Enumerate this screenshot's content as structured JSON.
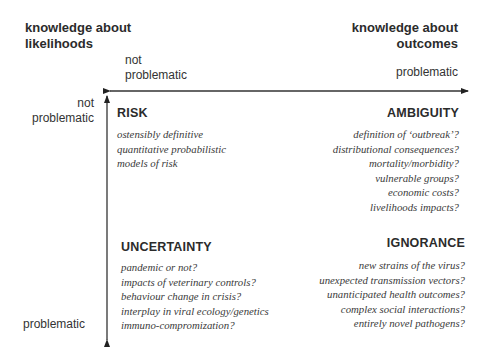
{
  "axes": {
    "likelihoods": {
      "title_line1": "knowledge about",
      "title_line2": "likelihoods",
      "top_label_line1": "not",
      "top_label_line2": "problematic",
      "bottom_label": "problematic"
    },
    "outcomes": {
      "title_line1": "knowledge about",
      "title_line2": "outcomes",
      "left_label_line1": "not",
      "left_label_line2": "problematic",
      "right_label": "problematic"
    }
  },
  "quadrants": {
    "risk": {
      "title": "RISK",
      "items": [
        "ostensibly definitive",
        "quantitative  probabilistic",
        "models of risk"
      ]
    },
    "ambiguity": {
      "title": "AMBIGUITY",
      "items": [
        "definition of ‘outbreak’?",
        "distributional consequences?",
        "mortality/morbidity?",
        "vulnerable groups?",
        "economic costs?",
        "livelihoods impacts?"
      ]
    },
    "uncertainty": {
      "title": "UNCERTAINTY",
      "items": [
        "pandemic or not?",
        "impacts of veterinary controls?",
        "behaviour change in crisis?",
        "interplay in viral ecology/genetics",
        "immuno-compromization?"
      ]
    },
    "ignorance": {
      "title": "IGNORANCE",
      "items": [
        "new strains of the virus?",
        "unexpected transmission vectors?",
        "unanticipated health outcomes?",
        "complex social interactions?",
        "entirely novel pathogens?"
      ]
    }
  }
}
